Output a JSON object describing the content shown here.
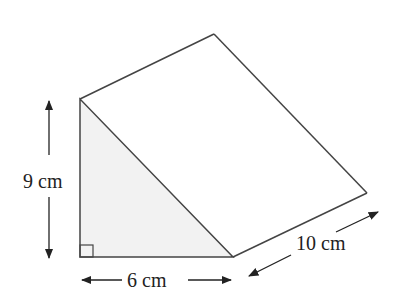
{
  "diagram": {
    "type": "triangular-prism",
    "colors": {
      "stroke": "#444444",
      "shade": "#f2f2f2",
      "text": "#222222"
    },
    "labels": {
      "height": "9 cm",
      "base": "6 cm",
      "length": "10 cm"
    },
    "right_angle_marker": true
  }
}
